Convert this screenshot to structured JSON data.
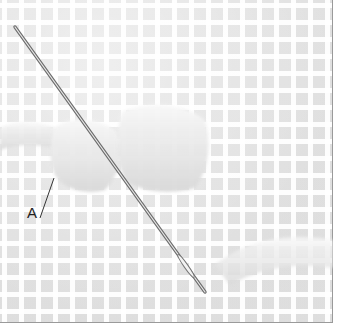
{
  "figure": {
    "label": "A",
    "colors": {
      "canvas_mesh": "#ffffff",
      "canvas_holes": "#d8d8d8",
      "yarn": "#eaeaea",
      "needle": "#8a8a8a",
      "border": "#9a9a9a",
      "label_text": "#222222"
    }
  }
}
